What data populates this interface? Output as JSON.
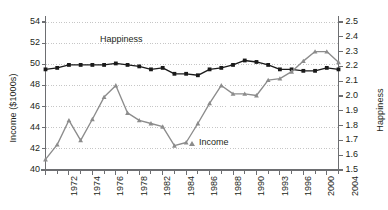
{
  "chart_data": {
    "type": "line",
    "title": "",
    "subtitle": "",
    "xlabel": "",
    "ylabel": "Income ($1000s)",
    "ylabel_right": "Happiness",
    "grid": true,
    "grid_style": "dotted horizontal gridlines",
    "legend_position": "inline annotations on plot",
    "x": [
      1972,
      1973,
      1974,
      1975,
      1976,
      1977,
      1978,
      1980,
      1982,
      1983,
      1984,
      1985,
      1986,
      1987,
      1988,
      1989,
      1990,
      1991,
      1993,
      1994,
      1996,
      1998,
      2000,
      2002,
      2004,
      2005
    ],
    "xtick_labels": [
      "1972",
      "",
      "1974",
      "",
      "1976",
      "",
      "1978",
      "",
      "1982",
      "",
      "1984",
      "",
      "1986",
      "",
      "1988",
      "",
      "1990",
      "",
      "1993",
      "",
      "1996",
      "",
      "2000",
      "",
      "2004",
      ""
    ],
    "xtick_labels_shown": [
      "1972",
      "1974",
      "1976",
      "1978",
      "1982",
      "1984",
      "1986",
      "1988",
      "1990",
      "1993",
      "1996",
      "2000",
      "2004"
    ],
    "ylim": [
      40,
      54
    ],
    "yticks": [
      40,
      42,
      44,
      46,
      48,
      50,
      52,
      54
    ],
    "ytick_labels": [
      "40",
      "42",
      "44",
      "46",
      "48",
      "50",
      "52",
      "54"
    ],
    "ylim_right": [
      1.5,
      2.5
    ],
    "yticks_right": [
      1.5,
      1.6,
      1.7,
      1.8,
      1.9,
      2.0,
      2.1,
      2.2,
      2.3,
      2.4,
      2.5
    ],
    "ytick_labels_right": [
      "1.5",
      "1.6",
      "1.7",
      "1.8",
      "1.9",
      "2.0",
      "2.1",
      "2.2",
      "2.3",
      "2.4",
      "2.5"
    ],
    "series": [
      {
        "name": "Happiness",
        "axis": "right",
        "color": "#1a1a1a",
        "marker": "square",
        "annotation": "Happiness",
        "values": [
          2.18,
          2.19,
          2.21,
          2.21,
          2.21,
          2.21,
          2.22,
          2.21,
          2.2,
          2.18,
          2.19,
          2.15,
          2.15,
          2.14,
          2.18,
          2.19,
          2.21,
          2.24,
          2.23,
          2.21,
          2.18,
          2.18,
          2.17,
          2.17,
          2.19,
          2.18
        ],
        "values_income_scale": [
          50.2,
          50.4,
          50.9,
          50.85,
          50.9,
          50.85,
          51.1,
          50.9,
          50.8,
          50.3,
          50.45,
          49.5,
          49.45,
          49.2,
          50.2,
          50.4,
          50.8,
          51.15,
          50.85,
          50.6,
          50.2,
          50.1,
          50.1,
          50.3,
          50.15,
          50.15
        ]
      },
      {
        "name": "Income",
        "axis": "left",
        "color": "#8c8c8c",
        "marker": "triangle",
        "annotation": "Income",
        "values": [
          41.0,
          42.4,
          44.7,
          42.8,
          44.8,
          46.9,
          48.0,
          45.4,
          44.7,
          44.4,
          44.1,
          42.3,
          42.6,
          44.4,
          46.3,
          48.0,
          47.2,
          47.2,
          47.05,
          48.5,
          48.65,
          49.3,
          50.3,
          51.2,
          51.2,
          50.2
        ]
      }
    ],
    "annotations": [
      {
        "text": "Happiness",
        "x": 1977,
        "y_right": 2.28
      },
      {
        "text": "Income",
        "x": 1989,
        "y_left": 42.7,
        "marker": "triangle"
      }
    ]
  },
  "colors": {
    "happiness": "#1a1a1a",
    "income": "#8c8c8c",
    "axis": "#6d6e71",
    "grid": "#b8b8b8",
    "text": "#231f20",
    "background": "#ffffff"
  },
  "axes": {
    "left_title": "Income ($1000s)",
    "right_title": "Happiness"
  }
}
